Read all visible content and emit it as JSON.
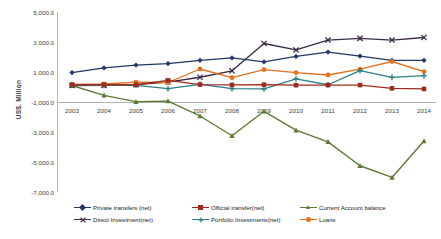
{
  "chart_data": {
    "type": "line",
    "title": "",
    "xlabel": "",
    "ylabel": "US$. Million",
    "categories": [
      "2003",
      "2004",
      "2005",
      "2006",
      "2007",
      "2008",
      "2009",
      "2010",
      "2011",
      "2012",
      "2013",
      "2014"
    ],
    "ylim": [
      -7000,
      5000
    ],
    "yticks": [
      "5,000.0",
      "3,000.0",
      "1,000.0",
      "-1,000.0",
      "-3,000.0",
      "-5,000.0",
      "-7,000.0"
    ],
    "ytick_values": [
      5000,
      3000,
      1000,
      -1000,
      -3000,
      -5000,
      -7000
    ],
    "grid": false,
    "legend_position": "bottom",
    "series": [
      {
        "name": "Private transfers (net)",
        "color": "#1F3864",
        "marker": "diamond",
        "values": [
          960,
          1270,
          1460,
          1560,
          1780,
          1940,
          1680,
          2040,
          2330,
          2060,
          1780,
          1780
        ]
      },
      {
        "name": "Official transfer(net)",
        "color": "#9E2B20",
        "marker": "square",
        "values": [
          150,
          150,
          150,
          440,
          160,
          140,
          160,
          120,
          130,
          130,
          -90,
          -130
        ]
      },
      {
        "name": "Current Account balance",
        "color": "#5B7A33",
        "marker": "triangle",
        "values": [
          100,
          -560,
          -980,
          -940,
          -1930,
          -3250,
          -1620,
          -2880,
          -3660,
          -5250,
          -6030,
          -3600
        ]
      },
      {
        "name": "Direct Investment(net)",
        "color": "#3B2A46",
        "marker": "x",
        "values": [
          100,
          110,
          160,
          330,
          650,
          1080,
          2900,
          2470,
          3130,
          3240,
          3130,
          3300
        ]
      },
      {
        "name": "Portfolio Investments(net)",
        "color": "#2E7F86",
        "marker": "plus",
        "values": [
          120,
          110,
          110,
          -110,
          180,
          -110,
          -130,
          540,
          150,
          1090,
          640,
          760
        ]
      },
      {
        "name": "Loans",
        "color": "#E2711D",
        "marker": "circle",
        "values": [
          180,
          200,
          320,
          300,
          1200,
          620,
          1160,
          960,
          800,
          1190,
          1700,
          1030
        ]
      }
    ]
  }
}
